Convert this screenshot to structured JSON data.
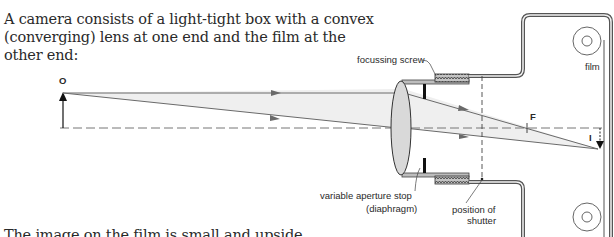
{
  "intro": {
    "text": "A camera consists of a light-tight box with a convex (converging) lens at one end and the film at the other end:"
  },
  "footer": {
    "text": "The image on the film is small and upside down"
  },
  "diagram": {
    "labels": {
      "object": "O",
      "image": "I",
      "focal_point": "F",
      "focussing_screw": "focussing screw",
      "film": "film",
      "aperture_line1": "variable aperture stop",
      "aperture_line2": "(diaphragm)",
      "shutter_line1": "position of",
      "shutter_line2": "shutter"
    },
    "colors": {
      "ray": "#6a6a6a",
      "beam_fill": "#ededed",
      "lens_fill": "#d9d9d9",
      "body": "#555555",
      "screw_fill": "#bfbfbf",
      "diaphragm": "#111111"
    }
  }
}
